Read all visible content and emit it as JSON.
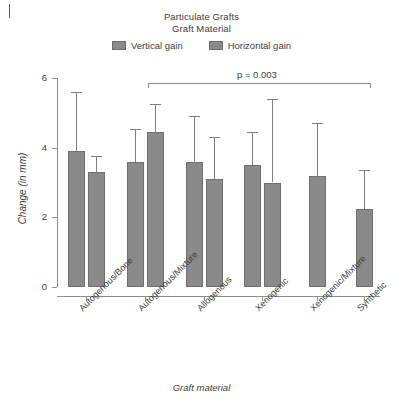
{
  "chart_data": {
    "type": "bar",
    "title": "Particulate Grafts",
    "subtitle": "Graft Material",
    "xlabel": "Graft material",
    "ylabel": "Change (in mm)",
    "ylim": [
      0,
      6
    ],
    "yticks": [
      0,
      2,
      4,
      6
    ],
    "ytick_labels": [
      "0",
      "2",
      "4",
      "6"
    ],
    "grid": false,
    "legend_position": "top-center",
    "categories": [
      "Autogenous/Bone",
      "Autogenous/Mixture",
      "Allogenous",
      "Xenogenic",
      "Xenogenic/Mixture",
      "Synthetic"
    ],
    "series": [
      {
        "name": "Vertical gain",
        "color": "#8a8a8a",
        "values": [
          3.9,
          3.6,
          3.6,
          3.5,
          3.2,
          2.25
        ],
        "err_upper": [
          5.6,
          4.55,
          4.9,
          4.45,
          4.7,
          3.35
        ]
      },
      {
        "name": "Horizontal gain",
        "color": "#8a8a8a",
        "values": [
          3.3,
          4.45,
          3.1,
          3.0,
          null,
          null
        ],
        "err_upper": [
          3.75,
          5.25,
          4.3,
          5.4,
          null,
          null
        ]
      }
    ],
    "annotations": [
      {
        "name": "significance-bracket",
        "label": "p = 0.003",
        "from_category": "Autogenous/Mixture",
        "to_category": "Synthetic",
        "y": 5.85
      }
    ]
  },
  "legend": {
    "items": [
      {
        "label": "Vertical gain",
        "swatch": "legend-swatch-vertical"
      },
      {
        "label": "Horizontal gain",
        "swatch": "legend-swatch-horizontal"
      }
    ]
  }
}
